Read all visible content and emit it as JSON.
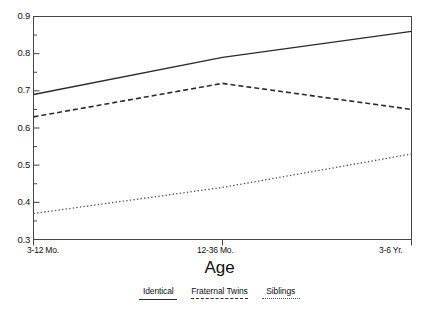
{
  "chart_data": {
    "type": "line",
    "title": "",
    "xlabel": "Age",
    "ylabel": "",
    "categories": [
      "3-12 Mo.",
      "12-36 Mo.",
      "3-6 Yr."
    ],
    "ylim": [
      0.3,
      0.9
    ],
    "yticks": [
      "0.3",
      "0.4",
      "0.5",
      "0.6",
      "0.7",
      "0.8",
      "0.9"
    ],
    "ytick_minor_step": 0.05,
    "grid": false,
    "legend_position": "bottom",
    "series": [
      {
        "name": "Identical",
        "style": "solid",
        "values": [
          0.69,
          0.79,
          0.86
        ]
      },
      {
        "name": "Fraternal Twins",
        "style": "dashed",
        "values": [
          0.63,
          0.72,
          0.65
        ]
      },
      {
        "name": "Siblings",
        "style": "dotted",
        "values": [
          0.37,
          0.44,
          0.53
        ]
      }
    ]
  },
  "axes": {
    "y_labels": [
      "0.9",
      "0.8",
      "0.7",
      "0.6",
      "0.5",
      "0.4",
      "0.3"
    ],
    "x_labels": {
      "first": "3-12 Mo.",
      "mid": "12-36 Mo.",
      "last": "3-6 Yr."
    },
    "x_title": "Age"
  },
  "legend": {
    "entries": [
      {
        "label": "Identical"
      },
      {
        "label": "Fraternal Twins"
      },
      {
        "label": "Siblings"
      }
    ]
  }
}
